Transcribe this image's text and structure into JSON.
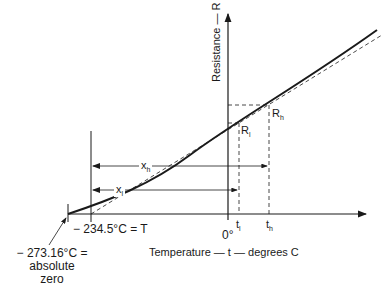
{
  "diagram": {
    "axes": {
      "y_label": "Resistance — R",
      "x_label": "Temperature — t — degrees C",
      "origin_label": "0°"
    },
    "points": {
      "t_low": {
        "base": "t",
        "sub": "l"
      },
      "t_high": {
        "base": "t",
        "sub": "h"
      },
      "R_low": {
        "base": "R",
        "sub": "l"
      },
      "R_high": {
        "base": "R",
        "sub": "h"
      }
    },
    "distances": {
      "x_low": {
        "base": "x",
        "sub": "l"
      },
      "x_high": {
        "base": "x",
        "sub": "h"
      }
    },
    "annotations": {
      "T_label": "− 234.5°C = T",
      "abs_zero_line1": "− 273.16°C =",
      "abs_zero_line2": "absolute",
      "abs_zero_line3": "zero"
    },
    "colors": {
      "ink": "#1a1a1a",
      "background": "#ffffff"
    }
  }
}
